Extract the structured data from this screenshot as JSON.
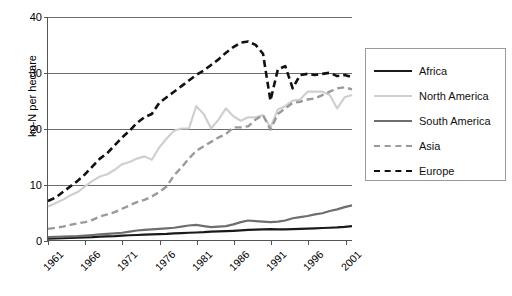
{
  "chart_data": {
    "type": "line",
    "title": "",
    "xlabel": "",
    "ylabel": "kg-N per hectare",
    "xlim": [
      1961,
      2002
    ],
    "ylim": [
      0,
      40
    ],
    "grid": true,
    "legend_position": "right",
    "ytick_labels": [
      "0",
      "10",
      "20",
      "30",
      "40"
    ],
    "ytick_values": [
      0,
      10,
      20,
      30,
      40
    ],
    "xtick_labels": [
      "1961",
      "1966",
      "1971",
      "1976",
      "1981",
      "1986",
      "1991",
      "1996",
      "2001"
    ],
    "xtick_values": [
      1961,
      1966,
      1971,
      1976,
      1981,
      1986,
      1991,
      1996,
      2001
    ],
    "x": [
      1961,
      1962,
      1963,
      1964,
      1965,
      1966,
      1967,
      1968,
      1969,
      1970,
      1971,
      1972,
      1973,
      1974,
      1975,
      1976,
      1977,
      1978,
      1979,
      1980,
      1981,
      1982,
      1983,
      1984,
      1985,
      1986,
      1987,
      1988,
      1989,
      1990,
      1991,
      1992,
      1993,
      1994,
      1995,
      1996,
      1997,
      1998,
      1999,
      2000,
      2001,
      2002
    ],
    "series": [
      {
        "name": "Africa",
        "color": "#1a1a1a",
        "style": "solid",
        "width": 2.2,
        "values": [
          0.25,
          0.3,
          0.32,
          0.38,
          0.42,
          0.48,
          0.52,
          0.6,
          0.65,
          0.7,
          0.8,
          0.85,
          0.9,
          0.95,
          1.0,
          1.05,
          1.1,
          1.2,
          1.25,
          1.3,
          1.35,
          1.4,
          1.5,
          1.55,
          1.6,
          1.65,
          1.72,
          1.8,
          1.85,
          1.9,
          1.95,
          1.9,
          1.92,
          1.95,
          2.0,
          2.05,
          2.1,
          2.15,
          2.2,
          2.25,
          2.35,
          2.5
        ]
      },
      {
        "name": "North America",
        "color": "#cfcfcf",
        "style": "solid",
        "width": 2.2,
        "values": [
          6.0,
          6.6,
          7.2,
          8.0,
          8.6,
          9.6,
          10.6,
          11.4,
          11.8,
          12.6,
          13.6,
          14.0,
          14.6,
          15.0,
          14.4,
          16.6,
          18.2,
          19.6,
          20.0,
          20.0,
          24.0,
          22.6,
          20.0,
          21.6,
          23.6,
          22.2,
          21.4,
          22.0,
          22.0,
          22.4,
          20.2,
          23.4,
          24.0,
          25.0,
          25.2,
          26.6,
          26.6,
          26.6,
          26.0,
          23.6,
          25.6,
          26.0
        ]
      },
      {
        "name": "South America",
        "color": "#6e6e6e",
        "style": "solid",
        "width": 2.2,
        "values": [
          0.5,
          0.55,
          0.6,
          0.65,
          0.7,
          0.8,
          0.9,
          1.0,
          1.1,
          1.2,
          1.3,
          1.5,
          1.7,
          1.8,
          1.9,
          2.0,
          2.1,
          2.2,
          2.4,
          2.6,
          2.7,
          2.5,
          2.3,
          2.4,
          2.5,
          2.8,
          3.2,
          3.5,
          3.4,
          3.3,
          3.2,
          3.3,
          3.5,
          3.9,
          4.1,
          4.3,
          4.6,
          4.8,
          5.2,
          5.5,
          5.9,
          6.2
        ]
      },
      {
        "name": "Asia",
        "color": "#9a9a9a",
        "style": "dashed",
        "width": 2.4,
        "values": [
          2.0,
          2.2,
          2.4,
          2.7,
          3.0,
          3.2,
          3.6,
          4.2,
          4.6,
          5.0,
          5.6,
          6.2,
          6.8,
          7.2,
          7.8,
          8.6,
          9.6,
          11.6,
          13.0,
          14.6,
          16.0,
          16.8,
          17.6,
          18.4,
          19.0,
          20.2,
          20.2,
          20.4,
          21.6,
          22.4,
          19.8,
          22.6,
          23.6,
          24.6,
          24.8,
          25.2,
          25.4,
          26.0,
          26.6,
          27.2,
          27.4,
          27.0
        ]
      },
      {
        "name": "Europe",
        "color": "#111111",
        "style": "dashed",
        "width": 2.6,
        "values": [
          7.0,
          7.6,
          8.6,
          9.6,
          10.6,
          11.8,
          13.2,
          14.6,
          15.6,
          17.0,
          18.4,
          19.6,
          21.0,
          22.0,
          22.6,
          24.6,
          25.6,
          26.6,
          27.6,
          28.6,
          29.6,
          30.4,
          31.4,
          32.4,
          33.6,
          34.6,
          35.4,
          35.6,
          35.0,
          33.4,
          25.0,
          30.6,
          31.2,
          27.2,
          29.6,
          29.8,
          29.6,
          29.8,
          30.0,
          29.4,
          29.6,
          29.2
        ]
      }
    ]
  },
  "legend": {
    "items": [
      {
        "label": "Africa"
      },
      {
        "label": "North America"
      },
      {
        "label": "South America"
      },
      {
        "label": "Asia"
      },
      {
        "label": "Europe"
      }
    ]
  }
}
